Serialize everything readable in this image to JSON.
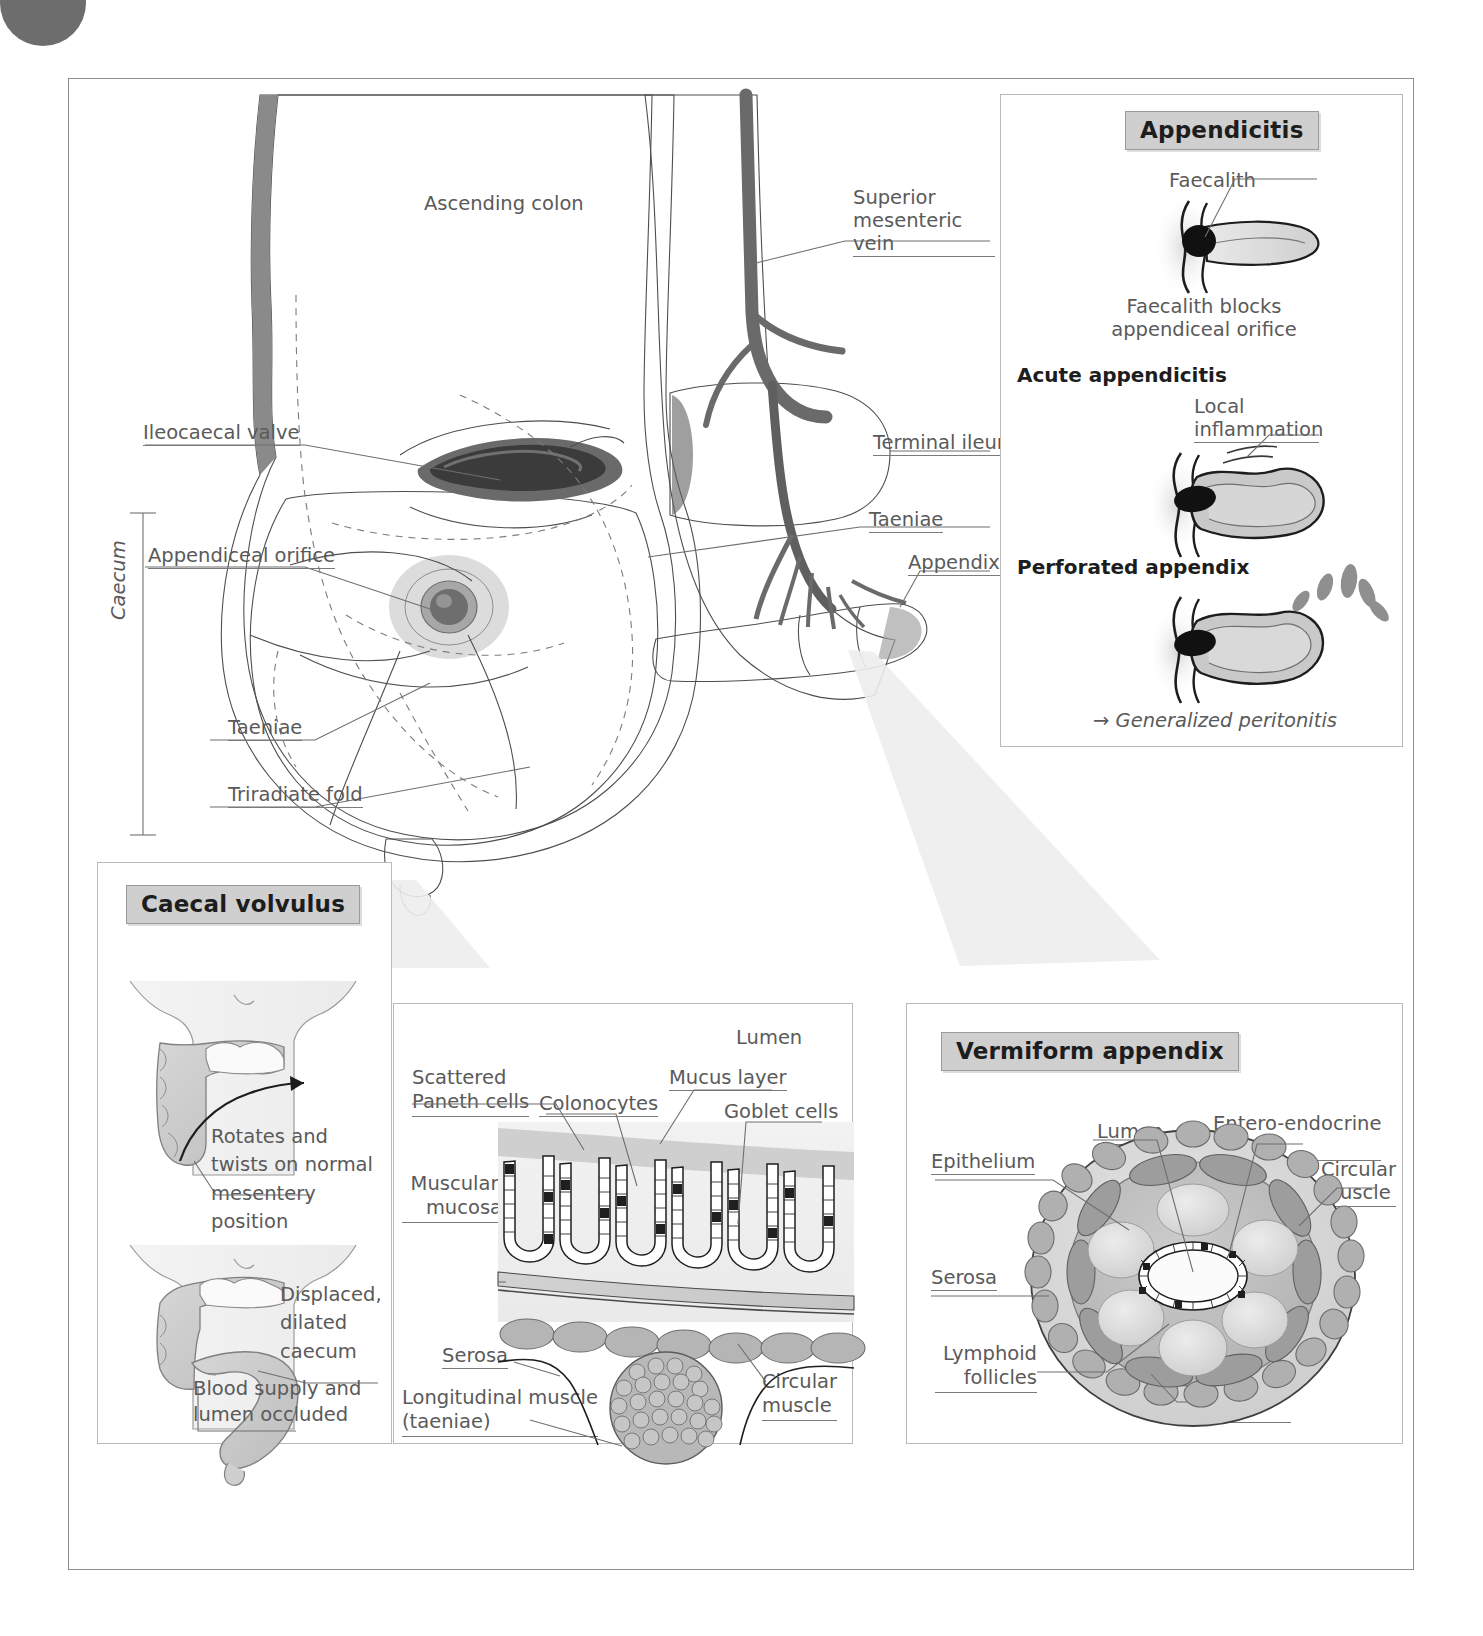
{
  "figure": {
    "main_labels": {
      "ascending_colon": "Ascending colon",
      "superior_mesenteric_vein": "Superior\nmesenteric vein",
      "ileocaecal_valve": "Ileocaecal valve",
      "terminal_ileum": "Terminal ileum",
      "appendiceal_orifice": "Appendiceal orifice",
      "taeniae_right": "Taeniae",
      "appendix": "Appendix",
      "caecum": "Caecum",
      "taeniae_left": "Taeniae",
      "triradiate_fold": "Triradiate fold"
    },
    "appendicitis_panel": {
      "title": "Appendicitis",
      "faecalith_label": "Faecalith",
      "faecalith_caption": "Faecalith blocks\nappendiceal orifice",
      "acute_heading": "Acute appendicitis",
      "local_inflammation_label": "Local\ninflammation",
      "perforated_heading": "Perforated appendix",
      "peritonitis_caption": "→ Generalized peritonitis"
    },
    "caecal_volvulus_panel": {
      "title": "Caecal volvulus",
      "rotates_caption": "Rotates and\ntwists on normal\nmesentery position",
      "displaced_caption": "Displaced,\ndilated\ncaecum",
      "occluded_caption": "Blood supply and\nlumen occluded"
    },
    "histology_panel": {
      "lumen": "Lumen",
      "scattered_paneth_cells": "Scattered\nPaneth cells",
      "colonocytes": "Colonocytes",
      "mucus_layer": "Mucus layer",
      "goblet_cells": "Goblet cells",
      "muscularis_mucosae": "Muscularis\nmucosae",
      "serosa": "Serosa",
      "longitudinal_muscle": "Longitudinal muscle\n(taeniae)",
      "circular_muscle": "Circular\nmuscle"
    },
    "vermiform_panel": {
      "title": "Vermiform appendix",
      "lumen": "Lumen",
      "entero_endocrine_cells": "Entero-endocrine\ncells",
      "epithelium": "Epithelium",
      "circular_muscle": "Circular\nmuscle",
      "serosa": "Serosa",
      "lymphoid_follicles": "Lymphoid\nfollicles",
      "longitudinal_muscle": "Longitudinal\nmuscle"
    },
    "colors": {
      "tissue_light": "#d4d4d4",
      "tissue_mid": "#b6b6b6",
      "tissue_dark": "#8a8a8a",
      "vessel": "#6e6e6e",
      "faecalith": "#111111",
      "title_bg": "#cfcfcf",
      "frame": "#8d8d8d",
      "text": "#5a5a5a"
    }
  }
}
